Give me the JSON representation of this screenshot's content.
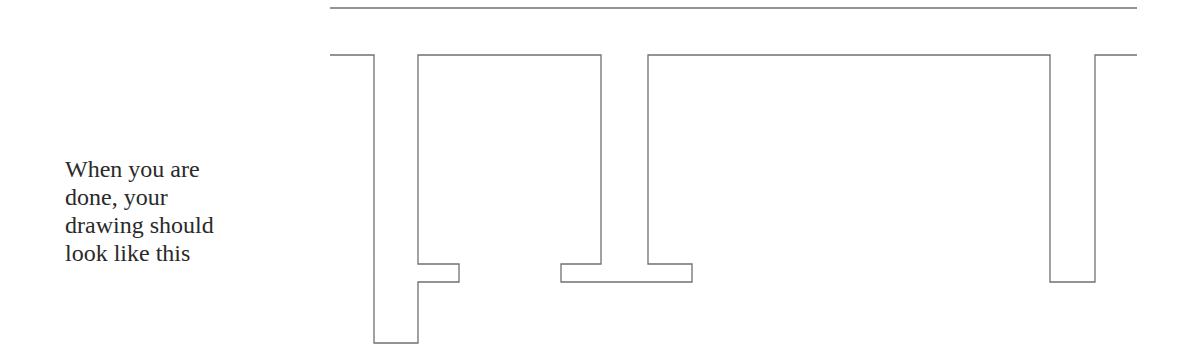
{
  "instruction": {
    "lines": [
      "When you are",
      "done, your",
      "drawing should",
      "look like this"
    ]
  },
  "drawing": {
    "stroke_color": "#707070",
    "top_line": {
      "x1": 330,
      "y1": 8,
      "x2": 1137,
      "y2": 8
    },
    "path_points": "330,55 374,55 374,343 418,343 418,282 459,282 459,264 418,264 418,55 601,55 601,264 561,264 561,282 692,282 692,264 648,264 648,55 1050,55 1050,282 1095,282 1095,55 1137,55"
  }
}
